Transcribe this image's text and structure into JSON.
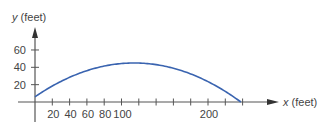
{
  "chart_data": {
    "type": "line",
    "title": "",
    "xlabel_var": "x",
    "xlabel_unit": "(feet)",
    "ylabel_var": "y",
    "ylabel_unit": "(feet)",
    "x_tick_labels": [
      "20",
      "40",
      "60",
      "80",
      "100",
      "200"
    ],
    "x_tick_values": [
      20,
      40,
      60,
      80,
      100,
      120,
      140,
      160,
      180,
      200,
      220,
      240
    ],
    "y_tick_labels": [
      "20",
      "40",
      "60"
    ],
    "y_tick_values": [
      20,
      40,
      60
    ],
    "xlim": [
      0,
      275
    ],
    "ylim": [
      0,
      80
    ],
    "grid": false,
    "legend": null,
    "series": [
      {
        "name": "trajectory",
        "color": "#3a64b0",
        "x": [
          0,
          20,
          40,
          60,
          80,
          100,
          116,
          140,
          160,
          180,
          200,
          220,
          238
        ],
        "y": [
          6,
          18,
          27,
          35,
          40,
          44,
          45,
          43,
          39,
          32,
          23,
          12,
          0
        ]
      }
    ]
  },
  "colors": {
    "axis": "#555555",
    "curve": "#3a64b0",
    "text": "#444444"
  }
}
